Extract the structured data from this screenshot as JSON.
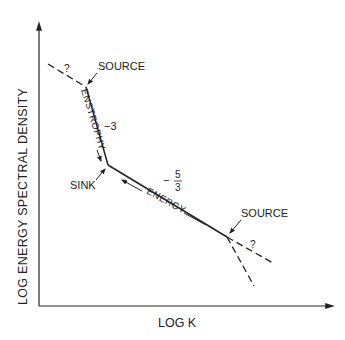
{
  "diagram": {
    "axes": {
      "y_label": "LOG ENERGY SPECTRAL DENSITY",
      "x_label": "LOG K"
    },
    "labels": {
      "source_top": "SOURCE",
      "source_right": "SOURCE",
      "sink": "SINK",
      "enstrophy": "ENSTROPHY",
      "energy": "ENERGY",
      "slope_steep": "−3",
      "slope_shallow_sign": "−",
      "slope_shallow_num": "5",
      "slope_shallow_den": "3",
      "unknown_top": "?",
      "unknown_right": "?"
    },
    "colors": {
      "line": "#222222",
      "background": "#ffffff"
    }
  }
}
